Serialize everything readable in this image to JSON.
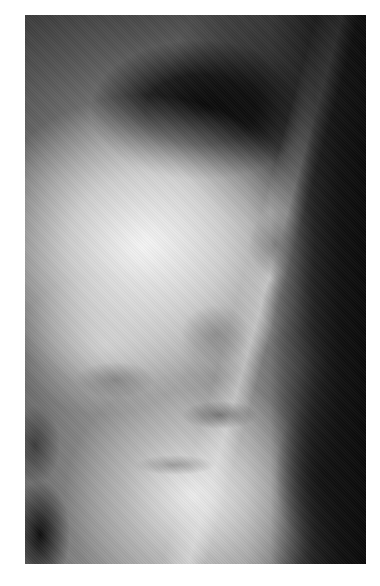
{
  "image": {
    "description": "Lateral radiograph (X-ray) of the thoracolumbar spine showing curvature with bright abdominal soft tissue and darker lung field at top",
    "alt": "Lateral spine X-ray",
    "colors": {
      "background": "#ffffff",
      "dark_region": "#0a0a0a",
      "bright_region": "#f5f5f5",
      "mid_gray": "#8a8a8a"
    }
  }
}
